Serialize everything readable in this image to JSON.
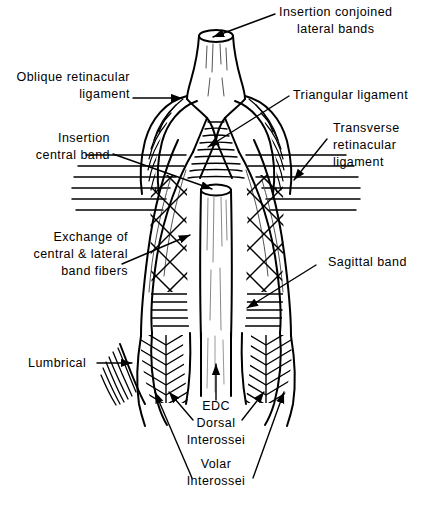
{
  "figure": {
    "background_color": "#ffffff",
    "ink_color": "#000000",
    "width": 430,
    "height": 505
  },
  "labels": {
    "insertion_conjoined_lateral_bands": {
      "line1": "Insertion conjoined",
      "line2": "lateral bands"
    },
    "oblique_retinacular_ligament": {
      "line1": "Oblique retinacular",
      "line2": "ligament"
    },
    "triangular_ligament": {
      "line1": "Triangular ligament"
    },
    "insertion_central_band": {
      "line1": "Insertion",
      "line2": "central band"
    },
    "transverse_retinacular_ligament": {
      "line1": "Transverse",
      "line2": "retinacular",
      "line3": "ligament"
    },
    "exchange_of_fibers": {
      "line1": "Exchange of",
      "line2": "central & lateral",
      "line3": "band fibers"
    },
    "sagittal_band": {
      "line1": "Sagittal band"
    },
    "lumbrical": {
      "line1": "Lumbrical"
    },
    "edc": {
      "line1": "EDC"
    },
    "dorsal_interossei": {
      "line1": "Dorsal",
      "line2": "Interossei"
    },
    "volar_interossei": {
      "line1": "Volar",
      "line2": "Interossei"
    }
  }
}
